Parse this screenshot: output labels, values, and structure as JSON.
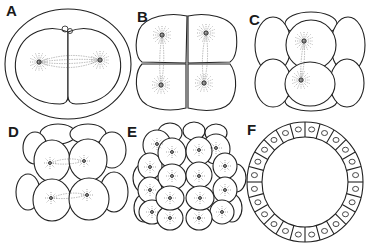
{
  "figure": {
    "panels": [
      {
        "id": "A",
        "label": "A",
        "stage": "2-cell",
        "cells": 2
      },
      {
        "id": "B",
        "label": "B",
        "stage": "4-cell",
        "cells": 4
      },
      {
        "id": "C",
        "label": "C",
        "stage": "8-cell",
        "cells": 8
      },
      {
        "id": "D",
        "label": "D",
        "stage": "16-cell",
        "cells": 16
      },
      {
        "id": "E",
        "label": "E",
        "stage": "32-cell",
        "cells": 32
      },
      {
        "id": "F",
        "label": "F",
        "stage": "blastula",
        "cells": 24
      }
    ],
    "colors": {
      "line": "#222222",
      "background": "#ffffff"
    }
  }
}
